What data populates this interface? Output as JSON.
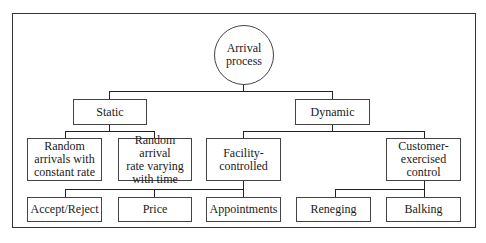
{
  "diagram": {
    "type": "tree",
    "root": {
      "id": "arrival",
      "label": "Arrival process",
      "line1": "Arrival",
      "line2": "process",
      "shape": "circle"
    },
    "level1": [
      {
        "id": "static",
        "label": "Static"
      },
      {
        "id": "dynamic",
        "label": "Dynamic"
      }
    ],
    "level2": [
      {
        "id": "random_constant",
        "parent": "static",
        "lines": [
          "Random",
          "arrivals with",
          "constant rate"
        ]
      },
      {
        "id": "random_varying",
        "parent": "static",
        "lines": [
          "Random arrival",
          "rate varying",
          "with time"
        ]
      },
      {
        "id": "facility",
        "parent": "dynamic",
        "lines": [
          "Facility-",
          "controlled"
        ]
      },
      {
        "id": "customer",
        "parent": "dynamic",
        "lines": [
          "Customer-",
          "exercised",
          "control"
        ]
      }
    ],
    "level3": [
      {
        "id": "accept_reject",
        "parent": "facility",
        "label": "Accept/Reject"
      },
      {
        "id": "price",
        "parent": "facility",
        "label": "Price"
      },
      {
        "id": "appointments",
        "parent": "facility",
        "label": "Appointments"
      },
      {
        "id": "reneging",
        "parent": "customer",
        "label": "Reneging"
      },
      {
        "id": "balking",
        "parent": "customer",
        "label": "Balking"
      }
    ]
  }
}
